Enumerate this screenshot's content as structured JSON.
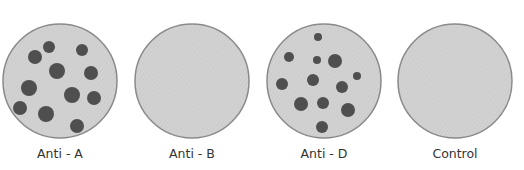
{
  "colors": {
    "plate_fill": "#d0d0d0",
    "plate_stroke": "#8a8a8a",
    "clump": "#4f4f4f",
    "label_text": "#333333",
    "background": "#ffffff"
  },
  "plates": [
    {
      "label": "Anti - A",
      "agglutination": true,
      "center": [
        60,
        81
      ],
      "radius": 57,
      "clumps": [
        [
          49,
          47,
          6
        ],
        [
          35,
          57,
          7
        ],
        [
          82,
          50,
          6
        ],
        [
          57,
          71,
          8
        ],
        [
          91,
          73,
          7
        ],
        [
          29,
          88,
          8
        ],
        [
          72,
          95,
          8
        ],
        [
          94,
          98,
          7
        ],
        [
          20,
          108,
          7
        ],
        [
          46,
          114,
          8
        ],
        [
          77,
          126,
          7
        ]
      ]
    },
    {
      "label": "Anti - B",
      "agglutination": false,
      "center": [
        192,
        81
      ],
      "radius": 57,
      "clumps": []
    },
    {
      "label": "Anti - D",
      "agglutination": true,
      "center": [
        324,
        81
      ],
      "radius": 57,
      "clumps": [
        [
          318,
          37,
          4
        ],
        [
          289,
          57,
          5
        ],
        [
          317,
          60,
          4
        ],
        [
          335,
          61,
          7
        ],
        [
          357,
          76,
          4
        ],
        [
          282,
          84,
          6
        ],
        [
          313,
          80,
          6
        ],
        [
          342,
          87,
          6
        ],
        [
          301,
          104,
          7
        ],
        [
          323,
          103,
          6
        ],
        [
          348,
          110,
          7
        ],
        [
          322,
          127,
          6
        ]
      ]
    },
    {
      "label": "Control",
      "agglutination": false,
      "center": [
        455,
        81
      ],
      "radius": 57,
      "clumps": []
    }
  ]
}
